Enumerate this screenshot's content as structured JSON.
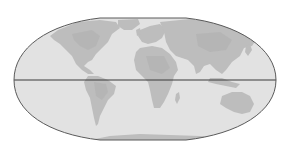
{
  "map": {
    "projection": "flat-polar pseudocylindrical world map",
    "colors": {
      "background": "#ffffff",
      "ocean": "#e2e2e2",
      "land": "#bdbdbd",
      "land_dark": "#b2b2b2",
      "outline": "#5a5a5a",
      "equator": "#3a3a3a"
    },
    "features": {
      "equator_line": true,
      "continents": [
        "North America",
        "South America",
        "Europe",
        "Africa",
        "Asia",
        "Australia",
        "Antarctica"
      ]
    }
  }
}
